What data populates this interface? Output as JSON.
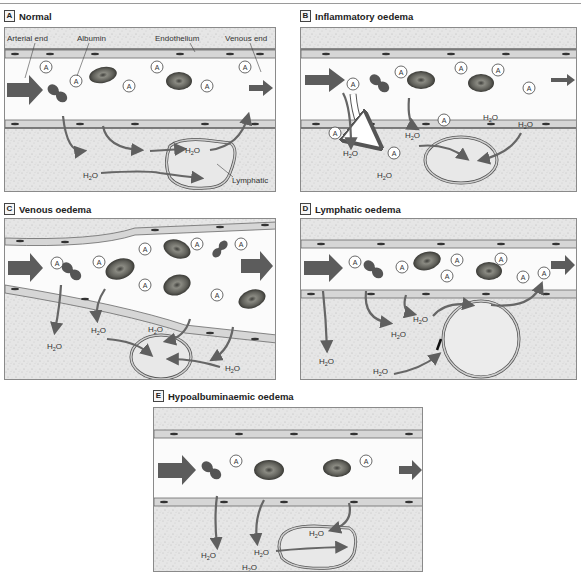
{
  "figure": {
    "panels": [
      {
        "letter": "A",
        "title": "Normal",
        "labels": {
          "arterial_end": "Arterial end",
          "albumin": "Albumin",
          "endothelium": "Endothelium",
          "venous_end": "Venous end",
          "lymphatic": "Lymphatic"
        },
        "water_labels": [
          "H2O",
          "H2O"
        ]
      },
      {
        "letter": "B",
        "title": "Inflammatory oedema",
        "water_labels": [
          "H2O",
          "H2O",
          "H2O",
          "H2O",
          "H2O"
        ]
      },
      {
        "letter": "C",
        "title": "Venous oedema",
        "water_labels": [
          "H2O",
          "H2O",
          "H2O",
          "H2O"
        ]
      },
      {
        "letter": "D",
        "title": "Lymphatic oedema",
        "water_labels": [
          "H2O",
          "H2O",
          "H2O",
          "H2O"
        ]
      },
      {
        "letter": "E",
        "title": "Hypoalbuminaemic oedema",
        "water_labels": [
          "H2O",
          "H2O",
          "H2O",
          "H2O"
        ]
      }
    ],
    "albumin_symbol": "A",
    "water_symbol": {
      "main": "H",
      "sub": "2",
      "tail": "O"
    },
    "colors": {
      "interstitium": "#e4e4e4",
      "vessel_lumen": "#fbfbfb",
      "endothelium_fill": "#d8d8d8",
      "endothelium_edge": "#6a6a6a",
      "nucleus": "#3a3a3a",
      "rbc": "#5f5f5a",
      "rbc_center": "#8a8a84",
      "flow_arrow": "#5c5c5c",
      "fluid_arrow": "#666666",
      "panel_border": "#8a8a8a"
    }
  }
}
